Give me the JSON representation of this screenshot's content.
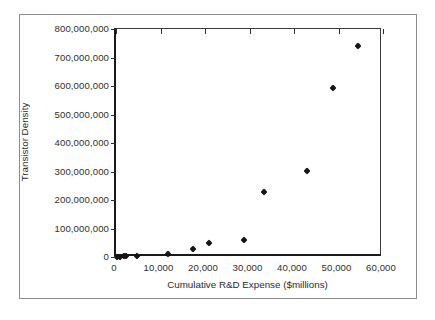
{
  "chart_data": {
    "type": "scatter",
    "title": "",
    "xlabel": "Cumulative R&D Expense ($millions)",
    "ylabel": "Transistor Density",
    "xlim": [
      0,
      60000
    ],
    "ylim": [
      0,
      800000000
    ],
    "grid": false,
    "legend": "none",
    "marker": "diamond",
    "marker_color": "#141414",
    "xticks": [
      0,
      10000,
      20000,
      30000,
      40000,
      50000,
      60000
    ],
    "xticklabels": [
      "0",
      "10,000",
      "20,000",
      "30,000",
      "40,000",
      "50,000",
      "60,000"
    ],
    "yticks": [
      0,
      100000000,
      200000000,
      300000000,
      400000000,
      500000000,
      600000000,
      700000000,
      800000000
    ],
    "yticklabels": [
      "0",
      "100,000,000",
      "200,000,000",
      "300,000,000",
      "400,000,000",
      "500,000,000",
      "600,000,000",
      "700,000,000",
      "800,000,000"
    ],
    "series": [
      {
        "name": "Transistor Density vs Cumulative R&D Expense",
        "points": [
          {
            "x": 250,
            "y": 1000000
          },
          {
            "x": 950,
            "y": 1200000
          },
          {
            "x": 1750,
            "y": 2000000
          },
          {
            "x": 2350,
            "y": 2200000
          },
          {
            "x": 4700,
            "y": 4500000
          },
          {
            "x": 11700,
            "y": 9000000
          },
          {
            "x": 17300,
            "y": 28000000
          },
          {
            "x": 21000,
            "y": 50000000
          },
          {
            "x": 28700,
            "y": 60000000
          },
          {
            "x": 33200,
            "y": 228000000
          },
          {
            "x": 43000,
            "y": 301000000
          },
          {
            "x": 48800,
            "y": 592000000
          },
          {
            "x": 54400,
            "y": 742000000
          }
        ]
      }
    ]
  },
  "figure": {
    "background_color": "#ffffff",
    "frame_color": "#8c8c8c",
    "axis_color": "#1a1a1a"
  }
}
